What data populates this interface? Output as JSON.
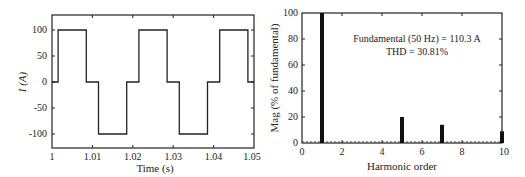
{
  "chart_data": [
    {
      "type": "line",
      "title": "",
      "xlabel": "Time (s)",
      "ylabel": "I (A)",
      "xlim": [
        1.0,
        1.05
      ],
      "ylim": [
        -125,
        125
      ],
      "xticks": [
        1,
        1.01,
        1.02,
        1.03,
        1.04,
        1.05
      ],
      "xtick_labels": [
        "1",
        "1.01",
        "1.02",
        "1.03",
        "1.04",
        "1.05"
      ],
      "yticks": [
        100,
        50,
        0,
        -50,
        -100
      ],
      "ytick_labels": [
        "100",
        "50",
        "0",
        "-50",
        "-100"
      ],
      "grid": false,
      "series": [
        {
          "name": "Current",
          "x": [
            1.0,
            1.0015,
            1.0015,
            1.0085,
            1.0085,
            1.0115,
            1.0115,
            1.0185,
            1.0185,
            1.0215,
            1.0215,
            1.0285,
            1.0285,
            1.0315,
            1.0315,
            1.0385,
            1.0385,
            1.0415,
            1.0415,
            1.0485,
            1.0485,
            1.05
          ],
          "y": [
            0,
            0,
            100,
            100,
            0,
            0,
            -100,
            -100,
            0,
            0,
            100,
            100,
            0,
            0,
            -100,
            -100,
            0,
            0,
            100,
            100,
            0,
            0
          ]
        }
      ]
    },
    {
      "type": "bar",
      "title": "",
      "xlabel": "Harmonic order",
      "ylabel": "Mag (% of fundamental)",
      "xlim": [
        0,
        10
      ],
      "ylim": [
        0,
        100
      ],
      "xticks": [
        0,
        2,
        4,
        6,
        8,
        10
      ],
      "xtick_labels": [
        "0",
        "2",
        "4",
        "6",
        "8",
        "10"
      ],
      "yticks": [
        0,
        20,
        40,
        60,
        80,
        100
      ],
      "ytick_labels": [
        "0",
        "20",
        "40",
        "60",
        "80",
        "100"
      ],
      "grid": false,
      "categories": [
        0,
        1,
        2,
        3,
        4,
        5,
        6,
        7,
        8,
        9,
        10
      ],
      "values": [
        0,
        100,
        0,
        0,
        0,
        20,
        0,
        14,
        0,
        0,
        9
      ],
      "annotations": [
        "Fundamental (50 Hz) = 110.3 A",
        "THD = 30.81%"
      ]
    }
  ],
  "left": {
    "xlabel": "Time (s)",
    "ylabel": "I (A)",
    "xticks": [
      "1",
      "1.01",
      "1.02",
      "1.03",
      "1.04",
      "1.05"
    ],
    "yticks": [
      "100",
      "50",
      "0",
      "-50",
      "-100"
    ]
  },
  "right": {
    "xlabel": "Harmonic order",
    "ylabel": "Mag (% of fundamental)",
    "xticks": [
      "0",
      "2",
      "4",
      "6",
      "8",
      "10"
    ],
    "yticks": [
      "0",
      "20",
      "40",
      "60",
      "80",
      "100"
    ],
    "annotation_line1": "Fundamental (50 Hz) = 110.3 A",
    "annotation_line2": "THD = 30.81%"
  }
}
